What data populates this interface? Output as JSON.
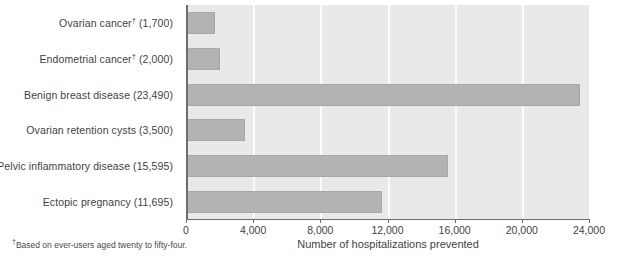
{
  "chart_data": {
    "type": "bar",
    "orientation": "horizontal",
    "title": "",
    "xlabel": "Number of hospitalizations prevented",
    "ylabel": "",
    "xlim": [
      0,
      24000
    ],
    "xticks": [
      0,
      4000,
      8000,
      12000,
      16000,
      20000,
      24000
    ],
    "xtick_labels": [
      "0",
      "4,000",
      "8,000",
      "12,000",
      "16,000",
      "20,000",
      "24,000"
    ],
    "grid": true,
    "grid_axis": "x",
    "legend": false,
    "categories": [
      "Ovarian cancer† (1,700)",
      "Endometrial cancer† (2,000)",
      "Benign breast disease (23,490)",
      "Ovarian retention cysts (3,500)",
      "Pelvic inflammatory disease (15,595)",
      "Ectopic pregnancy (11,695)"
    ],
    "category_names": [
      "Ovarian cancer",
      "Endometrial cancer",
      "Benign breast disease",
      "Ovarian retention cysts",
      "Pelvic inflammatory disease",
      "Ectopic pregnancy"
    ],
    "category_footnote_marks": [
      "†",
      "†",
      "",
      "",
      "",
      ""
    ],
    "values": [
      1700,
      2000,
      23490,
      3500,
      15595,
      11695
    ],
    "bar_color": "#b3b3b3",
    "plot_background": "#e9e9e9",
    "gridline_color": "#fbfbfb",
    "axis_color": "#6d6d6d"
  },
  "footnote": {
    "marker": "†",
    "text": "Based on ever-users aged twenty to fifty-four."
  },
  "axis": {
    "x_title": "Number of hospitalizations prevented"
  }
}
